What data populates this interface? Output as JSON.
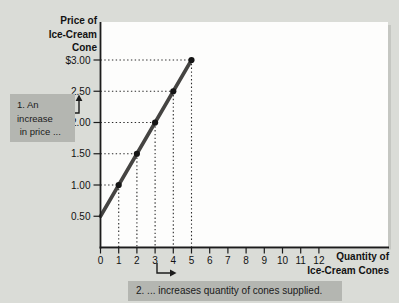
{
  "figure": {
    "background_color": "#dadcd7",
    "plot_background": "#fdfdfc",
    "colors": {
      "supply_line": "#454442",
      "axis": "#1c1c1c",
      "dotted_guides": "#2a2a2a",
      "annotation_box": "#b4b6b1",
      "text": "#121212",
      "plot_right_shadow": "#c5c7c2"
    }
  },
  "chart_data": {
    "type": "line",
    "title": "",
    "xlabel": "Quantity of Ice-Cream Cones",
    "xlabel_lines": [
      "Quantity of",
      "Ice-Cream Cones"
    ],
    "ylabel": "Price of Ice-Cream Cone",
    "ylabel_lines": [
      "Price of",
      "Ice-Cream",
      "Cone"
    ],
    "xlim": [
      0,
      12
    ],
    "ylim": [
      0,
      3
    ],
    "grid": false,
    "legend": false,
    "x_ticks": [
      "0",
      "1",
      "2",
      "3",
      "4",
      "5",
      "6",
      "7",
      "8",
      "9",
      "10",
      "11",
      "12"
    ],
    "y_ticks": [
      {
        "label": "$3.00",
        "value": 3.0
      },
      {
        "label": "2.50",
        "value": 2.5
      },
      {
        "label": "2.00",
        "value": 2.0
      },
      {
        "label": "1.50",
        "value": 1.5
      },
      {
        "label": "1.00",
        "value": 1.0
      },
      {
        "label": "0.50",
        "value": 0.5
      }
    ],
    "series": [
      {
        "name": "Supply curve",
        "points": [
          [
            0,
            0.5
          ],
          [
            1,
            1.0
          ],
          [
            2,
            1.5
          ],
          [
            3,
            2.0
          ],
          [
            4,
            2.5
          ],
          [
            5,
            3.0
          ]
        ],
        "marker_points": [
          [
            1,
            1.0
          ],
          [
            2,
            1.5
          ],
          [
            3,
            2.0
          ],
          [
            4,
            2.5
          ],
          [
            5,
            3.0
          ]
        ],
        "guides": "dotted projection lines from each marker to both axes"
      }
    ],
    "annotations": [
      {
        "id": "1",
        "lines": [
          "1. An",
          "increase",
          " in price ..."
        ],
        "text": "1. An increase in price ...",
        "arrow_direction": "up",
        "arrow_meaning": "price rises from $2.00 toward $2.50"
      },
      {
        "id": "2",
        "text": "2. ... increases quantity of cones supplied.",
        "arrow_direction": "right",
        "arrow_meaning": "quantity rises from 3 toward 4"
      }
    ]
  }
}
